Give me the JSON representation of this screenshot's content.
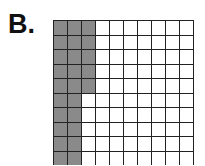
{
  "label": "B.",
  "grid": {
    "rows": 10,
    "cols": 10,
    "shaded_color": "#8a8a8a",
    "shaded_count": 25,
    "total_count": 100,
    "shaded_description": "Columns 1-2 fully shaded (20 squares) plus top 5 squares of column 3",
    "shaded_cells": [
      [
        1,
        1,
        1,
        0,
        0,
        0,
        0,
        0,
        0,
        0
      ],
      [
        1,
        1,
        1,
        0,
        0,
        0,
        0,
        0,
        0,
        0
      ],
      [
        1,
        1,
        1,
        0,
        0,
        0,
        0,
        0,
        0,
        0
      ],
      [
        1,
        1,
        1,
        0,
        0,
        0,
        0,
        0,
        0,
        0
      ],
      [
        1,
        1,
        1,
        0,
        0,
        0,
        0,
        0,
        0,
        0
      ],
      [
        1,
        1,
        0,
        0,
        0,
        0,
        0,
        0,
        0,
        0
      ],
      [
        1,
        1,
        0,
        0,
        0,
        0,
        0,
        0,
        0,
        0
      ],
      [
        1,
        1,
        0,
        0,
        0,
        0,
        0,
        0,
        0,
        0
      ],
      [
        1,
        1,
        0,
        0,
        0,
        0,
        0,
        0,
        0,
        0
      ],
      [
        1,
        1,
        0,
        0,
        0,
        0,
        0,
        0,
        0,
        0
      ]
    ]
  }
}
